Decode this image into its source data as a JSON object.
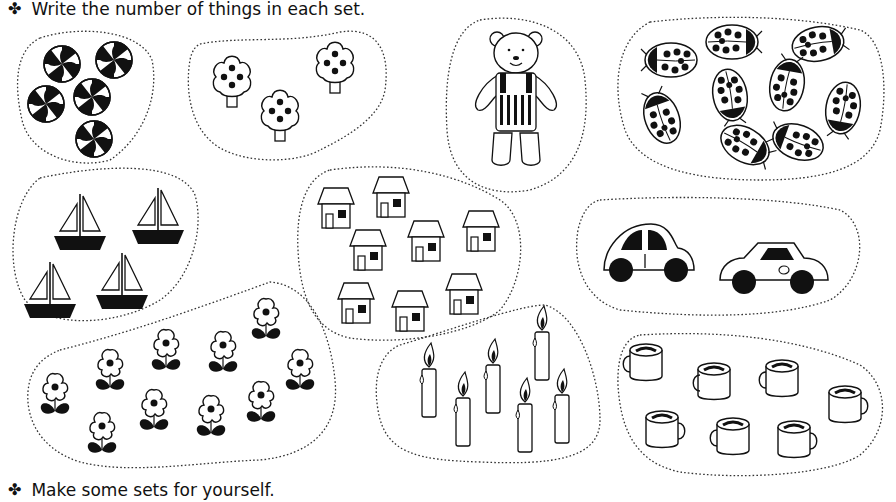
{
  "instructions": {
    "top": "Write the number of things in each set.",
    "bottom": "Make some sets for yourself.",
    "bullet": "✤"
  },
  "sets": [
    {
      "name": "swirl-candies",
      "item": "swirl candy",
      "count": 5
    },
    {
      "name": "trees",
      "item": "tree",
      "count": 3
    },
    {
      "name": "teddy-bear",
      "item": "teddy bear",
      "count": 1
    },
    {
      "name": "ladybugs",
      "item": "ladybug",
      "count": 10
    },
    {
      "name": "sailboats",
      "item": "sailboat",
      "count": 4
    },
    {
      "name": "houses",
      "item": "house",
      "count": 8
    },
    {
      "name": "cars",
      "item": "car",
      "count": 2
    },
    {
      "name": "flowers",
      "item": "flower",
      "count": 11
    },
    {
      "name": "candles",
      "item": "candle",
      "count": 6
    },
    {
      "name": "mugs",
      "item": "mug",
      "count": 7
    }
  ]
}
